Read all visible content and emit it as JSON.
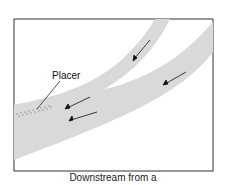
{
  "figure": {
    "label": "Placer",
    "caption": "Downstream from a",
    "colors": {
      "channel": "#d9d9d9",
      "frame": "#333333",
      "arrow": "#111111",
      "deposit": "#888888"
    }
  }
}
